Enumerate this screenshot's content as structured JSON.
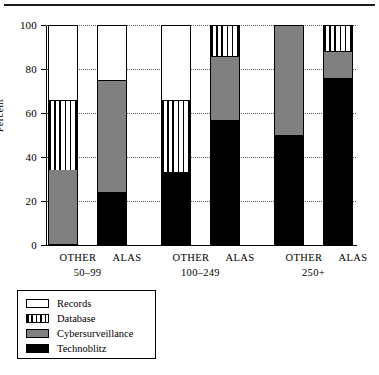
{
  "chart_data": {
    "type": "bar",
    "subtype": "stacked-bar-grouped",
    "title": "",
    "xlabel": "",
    "ylabel": "Percent",
    "ylim": [
      0,
      100
    ],
    "yticks": [
      0,
      20,
      40,
      60,
      80,
      100
    ],
    "ytick_labels": [
      "0",
      "20",
      "40",
      "60",
      "80",
      "100"
    ],
    "grid": "horizontal-dotted",
    "legend_position": "below-left",
    "groups": [
      {
        "label": "50–99",
        "categories": [
          "OTHER",
          "ALAS"
        ]
      },
      {
        "label": "100–249",
        "categories": [
          "OTHER",
          "ALAS"
        ]
      },
      {
        "label": "250+",
        "categories": [
          "OTHER",
          "ALAS"
        ]
      }
    ],
    "categories": [
      "50–99 OTHER",
      "50–99 ALAS",
      "100–249 OTHER",
      "100–249 ALAS",
      "250+ OTHER",
      "250+ ALAS"
    ],
    "series": [
      {
        "name": "Technoblitz",
        "fill": "black",
        "color": "#000000",
        "values": [
          0,
          24,
          33,
          57,
          50,
          76
        ]
      },
      {
        "name": "Cybersurveillance",
        "fill": "gray",
        "color": "#808080",
        "values": [
          34,
          51,
          0,
          29,
          50,
          12
        ]
      },
      {
        "name": "Database",
        "fill": "vertical-stripes",
        "color": "#ffffff",
        "values": [
          32,
          0,
          33,
          14,
          0,
          12
        ]
      },
      {
        "name": "Records",
        "fill": "white",
        "color": "#ffffff",
        "values": [
          34,
          25,
          34,
          0,
          0,
          0
        ]
      }
    ],
    "bars": [
      {
        "group": "50–99",
        "category": "OTHER",
        "segments": [
          {
            "series": "Technoblitz",
            "value": 0,
            "from": 0,
            "to": 0
          },
          {
            "series": "Cybersurveillance",
            "value": 34,
            "from": 0,
            "to": 34
          },
          {
            "series": "Database",
            "value": 32,
            "from": 34,
            "to": 66
          },
          {
            "series": "Records",
            "value": 34,
            "from": 66,
            "to": 100
          }
        ]
      },
      {
        "group": "50–99",
        "category": "ALAS",
        "segments": [
          {
            "series": "Technoblitz",
            "value": 24,
            "from": 0,
            "to": 24
          },
          {
            "series": "Cybersurveillance",
            "value": 51,
            "from": 24,
            "to": 75
          },
          {
            "series": "Database",
            "value": 0,
            "from": 75,
            "to": 75
          },
          {
            "series": "Records",
            "value": 25,
            "from": 75,
            "to": 100
          }
        ]
      },
      {
        "group": "100–249",
        "category": "OTHER",
        "segments": [
          {
            "series": "Technoblitz",
            "value": 33,
            "from": 0,
            "to": 33
          },
          {
            "series": "Cybersurveillance",
            "value": 0,
            "from": 33,
            "to": 33
          },
          {
            "series": "Database",
            "value": 33,
            "from": 33,
            "to": 66
          },
          {
            "series": "Records",
            "value": 34,
            "from": 66,
            "to": 100
          }
        ]
      },
      {
        "group": "100–249",
        "category": "ALAS",
        "segments": [
          {
            "series": "Technoblitz",
            "value": 57,
            "from": 0,
            "to": 57
          },
          {
            "series": "Cybersurveillance",
            "value": 29,
            "from": 57,
            "to": 86
          },
          {
            "series": "Database",
            "value": 14,
            "from": 86,
            "to": 100
          },
          {
            "series": "Records",
            "value": 0,
            "from": 100,
            "to": 100
          }
        ]
      },
      {
        "group": "250+",
        "category": "OTHER",
        "segments": [
          {
            "series": "Technoblitz",
            "value": 50,
            "from": 0,
            "to": 50
          },
          {
            "series": "Cybersurveillance",
            "value": 50,
            "from": 50,
            "to": 100
          },
          {
            "series": "Database",
            "value": 0,
            "from": 100,
            "to": 100
          },
          {
            "series": "Records",
            "value": 0,
            "from": 100,
            "to": 100
          }
        ]
      },
      {
        "group": "250+",
        "category": "ALAS",
        "segments": [
          {
            "series": "Technoblitz",
            "value": 76,
            "from": 0,
            "to": 76
          },
          {
            "series": "Cybersurveillance",
            "value": 12,
            "from": 76,
            "to": 88
          },
          {
            "series": "Database",
            "value": 12,
            "from": 88,
            "to": 100
          },
          {
            "series": "Records",
            "value": 0,
            "from": 100,
            "to": 100
          }
        ]
      }
    ],
    "legend": [
      {
        "label": "Records",
        "swatch": "white"
      },
      {
        "label": "Database",
        "swatch": "vertical-stripes"
      },
      {
        "label": "Cybersurveillance",
        "swatch": "gray"
      },
      {
        "label": "Technoblitz",
        "swatch": "black"
      }
    ]
  }
}
